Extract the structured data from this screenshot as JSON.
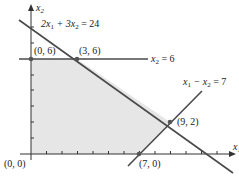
{
  "diagram": {
    "type": "linear-programming-feasible-region",
    "axes": {
      "x_label": "x",
      "x_sub": "1",
      "y_label": "x",
      "y_sub": "2"
    },
    "constraints": [
      {
        "id": "c1",
        "label": "2x₁ + 3x₂ = 24",
        "parts": {
          "a": "2x",
          "a_sub": "1",
          "op": " + 3x",
          "b_sub": "2",
          "rhs": " = 24"
        }
      },
      {
        "id": "c2",
        "label": "x₂ = 6",
        "parts": {
          "a": "x",
          "a_sub": "2",
          "rhs": " = 6"
        }
      },
      {
        "id": "c3",
        "label": "x₁ − x₂ = 7",
        "parts": {
          "a": "x",
          "a_sub": "1",
          "op": " − x",
          "b_sub": "2",
          "rhs": " = 7"
        }
      }
    ],
    "vertices": [
      {
        "label": "(0, 0)",
        "x": 0,
        "y": 0
      },
      {
        "label": "(0, 6)",
        "x": 0,
        "y": 6
      },
      {
        "label": "(3, 6)",
        "x": 3,
        "y": 6
      },
      {
        "label": "(9, 2)",
        "x": 9,
        "y": 2
      },
      {
        "label": "(7, 0)",
        "x": 7,
        "y": 0
      }
    ],
    "colors": {
      "line": "#4a4a4a",
      "feasible_fill": "#e6e6e6",
      "vertex": "#555555"
    }
  }
}
